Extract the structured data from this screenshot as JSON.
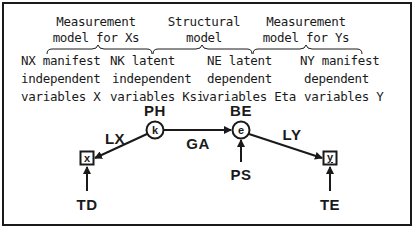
{
  "diagram": {
    "type": "LISREL path diagram",
    "colors": {
      "ink": "#1a1a1a",
      "background": "#ffffff"
    },
    "headers": [
      {
        "id": "measurement-x",
        "line1": "Measurement",
        "line2": "model for Xs"
      },
      {
        "id": "structural",
        "line1": "Structural",
        "line2": "model"
      },
      {
        "id": "measurement-y",
        "line1": "Measurement",
        "line2": "model for Ys"
      }
    ],
    "columns": [
      {
        "id": "nx",
        "line1": "NX manifest",
        "line2": "independent",
        "line3": "variables X"
      },
      {
        "id": "nk",
        "line1": "NK latent",
        "line2": "independent",
        "line3": "variables Ksi"
      },
      {
        "id": "ne",
        "line1": "NE latent",
        "line2": "dependent",
        "line3": "variables Eta"
      },
      {
        "id": "ny",
        "line1": "NY manifest",
        "line2": "dependent",
        "line3": "variables Y"
      }
    ],
    "nodes": {
      "x": {
        "glyph": "x",
        "shape": "square",
        "error_label": "TD"
      },
      "ksi": {
        "glyph": "k",
        "shape": "circle",
        "variance_label": "PH"
      },
      "eta": {
        "glyph": "e",
        "shape": "circle",
        "label": "BE",
        "error_label": "PS"
      },
      "y": {
        "glyph": "y",
        "shape": "square",
        "error_label": "TE"
      }
    },
    "paths": {
      "lx": "LX",
      "ga": "GA",
      "ly": "LY"
    }
  }
}
